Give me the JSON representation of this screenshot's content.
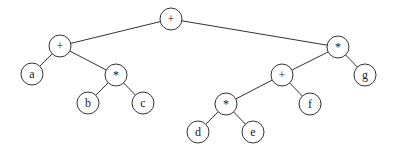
{
  "diagram": {
    "type": "expression-tree",
    "node_radius": 11,
    "colors": {
      "stroke": "#333333",
      "fill": "#ffffff",
      "text": "#222222"
    },
    "nodes": [
      {
        "id": "n0",
        "label": "+",
        "x": 171,
        "y": 19
      },
      {
        "id": "n1",
        "label": "+",
        "x": 60,
        "y": 46
      },
      {
        "id": "n2",
        "label": "a",
        "x": 32,
        "y": 74
      },
      {
        "id": "n3",
        "label": "*",
        "x": 116,
        "y": 75
      },
      {
        "id": "n4",
        "label": "b",
        "x": 88,
        "y": 103
      },
      {
        "id": "n5",
        "label": "c",
        "x": 143,
        "y": 103
      },
      {
        "id": "n6",
        "label": "*",
        "x": 338,
        "y": 47
      },
      {
        "id": "n7",
        "label": "+",
        "x": 282,
        "y": 75
      },
      {
        "id": "n8",
        "label": "g",
        "x": 365,
        "y": 75
      },
      {
        "id": "n9",
        "label": "*",
        "x": 226,
        "y": 104
      },
      {
        "id": "n10",
        "label": "f",
        "x": 310,
        "y": 104
      },
      {
        "id": "n11",
        "label": "d",
        "x": 198,
        "y": 132
      },
      {
        "id": "n12",
        "label": "e",
        "x": 253,
        "y": 132
      }
    ],
    "edges": [
      [
        "n0",
        "n1"
      ],
      [
        "n0",
        "n6"
      ],
      [
        "n1",
        "n2"
      ],
      [
        "n1",
        "n3"
      ],
      [
        "n3",
        "n4"
      ],
      [
        "n3",
        "n5"
      ],
      [
        "n6",
        "n7"
      ],
      [
        "n6",
        "n8"
      ],
      [
        "n7",
        "n9"
      ],
      [
        "n7",
        "n10"
      ],
      [
        "n9",
        "n11"
      ],
      [
        "n9",
        "n12"
      ]
    ]
  }
}
